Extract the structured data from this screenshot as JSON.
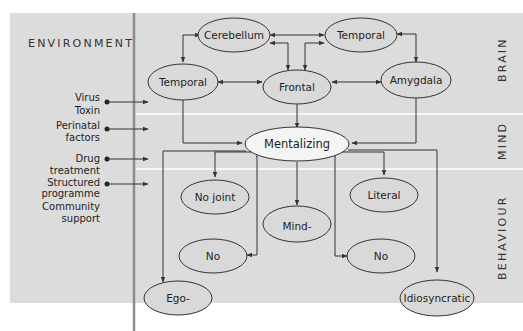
{
  "colors": {
    "panel_bg": "#dcdcdc",
    "band_divider": "#f7f7f7",
    "vertical_rule": "#8c8c8c",
    "node_fill": "#d9d9d9",
    "central_node_fill": "#f4f4f4",
    "stroke": "#333333",
    "page_bg": "#ffffff"
  },
  "environment": {
    "title": "ENVIRONMENT",
    "factors": [
      {
        "lines": [
          "Virus",
          "Toxin"
        ],
        "arrow": true
      },
      {
        "lines": [
          "Perinatal",
          "factors"
        ],
        "arrow": true
      },
      {
        "lines": [
          "Drug",
          "treatment"
        ],
        "arrow": true
      },
      {
        "lines": [
          "Structured",
          "programme"
        ],
        "arrow": true
      },
      {
        "lines": [
          "Community",
          "support"
        ],
        "arrow": false
      }
    ]
  },
  "levels": {
    "brain": "BRAIN",
    "mind": "MIND",
    "behaviour": "BEHAVIOUR"
  },
  "nodes": {
    "cerebellum": "Cerebellum",
    "temporal_top": "Temporal",
    "temporal_left": "Temporal",
    "frontal": "Frontal",
    "amygdala": "Amygdala",
    "mentalizing": "Mentalizing",
    "no_joint": "No joint",
    "literal": "Literal",
    "mind": "Mind-",
    "no_left": "No",
    "no_right": "No",
    "ego": "Ego-",
    "idiosyncratic": "Idiosyncratic"
  },
  "edges": [
    {
      "from": "cerebellum",
      "to": "temporal_left",
      "bidirectional": true
    },
    {
      "from": "cerebellum",
      "to": "temporal_top",
      "bidirectional": true
    },
    {
      "from": "cerebellum",
      "to": "frontal",
      "bidirectional": true
    },
    {
      "from": "temporal_top",
      "to": "frontal",
      "bidirectional": true
    },
    {
      "from": "temporal_top",
      "to": "amygdala",
      "bidirectional": true
    },
    {
      "from": "temporal_left",
      "to": "frontal",
      "bidirectional": true
    },
    {
      "from": "frontal",
      "to": "amygdala",
      "bidirectional": true
    },
    {
      "from": "temporal_left",
      "to": "mentalizing",
      "bidirectional": false
    },
    {
      "from": "frontal",
      "to": "mentalizing",
      "bidirectional": false
    },
    {
      "from": "amygdala",
      "to": "mentalizing",
      "bidirectional": false
    },
    {
      "from": "mentalizing",
      "to": "no_joint",
      "bidirectional": false
    },
    {
      "from": "mentalizing",
      "to": "literal",
      "bidirectional": false
    },
    {
      "from": "mentalizing",
      "to": "mind",
      "bidirectional": false
    },
    {
      "from": "mentalizing",
      "to": "no_left",
      "bidirectional": false
    },
    {
      "from": "mentalizing",
      "to": "no_right",
      "bidirectional": false
    },
    {
      "from": "mentalizing",
      "to": "ego",
      "bidirectional": false
    },
    {
      "from": "mentalizing",
      "to": "idiosyncratic",
      "bidirectional": false
    }
  ]
}
